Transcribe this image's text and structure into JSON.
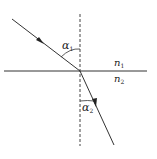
{
  "diagram": {
    "type": "refraction",
    "labels": {
      "alpha1": "α",
      "alpha1_sub": "1",
      "alpha2": "α",
      "alpha2_sub": "2",
      "n1": "n",
      "n1_sub": "1",
      "n2": "n",
      "n2_sub": "2"
    },
    "colors": {
      "line": "#333333",
      "background": "#ffffff"
    }
  }
}
